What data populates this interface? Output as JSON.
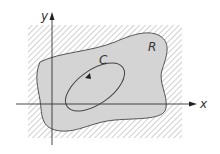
{
  "diagram": {
    "axes": {
      "x_label": "x",
      "y_label": "y"
    },
    "region": {
      "label": "R",
      "fill_color": "#d4d4d4",
      "outline_color": "#555555"
    },
    "curve": {
      "label": "C",
      "orientation": "counterclockwise",
      "stroke_color": "#444444"
    },
    "exterior": {
      "pattern": "diagonal-hatch",
      "hatch_color": "#b0b0b0"
    }
  }
}
